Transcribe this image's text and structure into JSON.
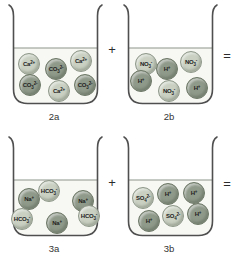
{
  "figure": {
    "colors": {
      "light_ion_fill": "#cad1c3",
      "light_ion_border": "#8f988a",
      "dark_ion_fill": "#909a8b",
      "dark_ion_border": "#6f7968",
      "beaker_outline": "#4f4f4f",
      "water_fill": "#f7f8f4",
      "water_line": "#8d948a",
      "label_text": "#222222"
    },
    "rows": [
      {
        "operator_between": "+",
        "operator_after": "=",
        "beakers": [
          {
            "caption": "2a",
            "ions": [
              {
                "name": "calcium-ion",
                "base": "Ca",
                "sub": "",
                "sup": "2+",
                "shade": "light",
                "x": 23,
                "y": 60
              },
              {
                "name": "carbonate-ion",
                "base": "CO",
                "sub": "3",
                "sup": "2-",
                "shade": "dark",
                "x": 50,
                "y": 65
              },
              {
                "name": "calcium-ion",
                "base": "Ca",
                "sub": "",
                "sup": "2+",
                "shade": "light",
                "x": 75,
                "y": 57
              },
              {
                "name": "carbonate-ion",
                "base": "CO",
                "sub": "3",
                "sup": "2-",
                "shade": "dark",
                "x": 24,
                "y": 81
              },
              {
                "name": "calcium-ion",
                "base": "Ca",
                "sub": "",
                "sup": "2+",
                "shade": "light",
                "x": 53,
                "y": 87
              },
              {
                "name": "carbonate-ion",
                "base": "CO",
                "sub": "3",
                "sup": "2-",
                "shade": "dark",
                "x": 79,
                "y": 81
              }
            ]
          },
          {
            "caption": "2b",
            "ions": [
              {
                "name": "nitrate-ion",
                "base": "NO",
                "sub": "3",
                "sup": "-",
                "shade": "light",
                "x": 25,
                "y": 60
              },
              {
                "name": "hydrogen-ion",
                "base": "H",
                "sub": "",
                "sup": "+",
                "shade": "dark",
                "x": 46,
                "y": 65
              },
              {
                "name": "nitrate-ion",
                "base": "NO",
                "sub": "3",
                "sup": "-",
                "shade": "light",
                "x": 70,
                "y": 58
              },
              {
                "name": "hydrogen-ion",
                "base": "H",
                "sub": "",
                "sup": "+",
                "shade": "dark",
                "x": 20,
                "y": 77
              },
              {
                "name": "nitrate-ion",
                "base": "NO",
                "sub": "3",
                "sup": "-",
                "shade": "light",
                "x": 48,
                "y": 87
              },
              {
                "name": "hydrogen-ion",
                "base": "H",
                "sub": "",
                "sup": "+",
                "shade": "dark",
                "x": 76,
                "y": 84
              }
            ]
          }
        ]
      },
      {
        "operator_between": "+",
        "operator_after": "=",
        "beakers": [
          {
            "caption": "3a",
            "ions": [
              {
                "name": "sodium-ion",
                "base": "Na",
                "sub": "",
                "sup": "+",
                "shade": "dark",
                "x": 23,
                "y": 63
              },
              {
                "name": "bicarbonate-ion",
                "base": "HCO",
                "sub": "3",
                "sup": "-",
                "shade": "light",
                "x": 43,
                "y": 55
              },
              {
                "name": "sodium-ion",
                "base": "Na",
                "sub": "",
                "sup": "+",
                "shade": "dark",
                "x": 77,
                "y": 65
              },
              {
                "name": "bicarbonate-ion",
                "base": "HCO",
                "sub": "3",
                "sup": "-",
                "shade": "light",
                "x": 16,
                "y": 83
              },
              {
                "name": "sodium-ion",
                "base": "Na",
                "sub": "",
                "sup": "+",
                "shade": "dark",
                "x": 51,
                "y": 87
              },
              {
                "name": "bicarbonate-ion",
                "base": "HCO",
                "sub": "3",
                "sup": "-",
                "shade": "light",
                "x": 83,
                "y": 80
              }
            ]
          },
          {
            "caption": "3b",
            "ions": [
              {
                "name": "sulfate-ion",
                "base": "SO",
                "sub": "4",
                "sup": "2-",
                "shade": "light",
                "x": 22,
                "y": 62
              },
              {
                "name": "hydrogen-ion",
                "base": "H",
                "sub": "",
                "sup": "+",
                "shade": "dark",
                "x": 47,
                "y": 58
              },
              {
                "name": "hydrogen-ion",
                "base": "H",
                "sub": "",
                "sup": "+",
                "shade": "dark",
                "x": 73,
                "y": 57
              },
              {
                "name": "hydrogen-ion",
                "base": "H",
                "sub": "",
                "sup": "+",
                "shade": "dark",
                "x": 28,
                "y": 85
              },
              {
                "name": "sulfate-ion",
                "base": "SO",
                "sub": "4",
                "sup": "2-",
                "shade": "light",
                "x": 52,
                "y": 80
              },
              {
                "name": "hydrogen-ion",
                "base": "H",
                "sub": "",
                "sup": "+",
                "shade": "dark",
                "x": 77,
                "y": 78
              }
            ]
          }
        ]
      }
    ]
  }
}
